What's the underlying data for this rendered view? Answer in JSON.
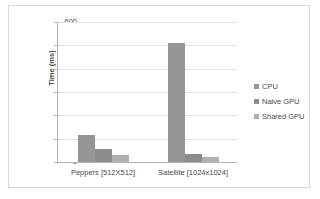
{
  "chart_data": {
    "type": "bar",
    "title": "",
    "subtitle": "",
    "xlabel": "",
    "ylabel": "Time (ms)",
    "ylim": [
      0,
      600
    ],
    "yticks": [
      0,
      100,
      200,
      300,
      400,
      500,
      600
    ],
    "ytick_labels": [
      "0",
      "100",
      "200",
      "300",
      "400",
      "500",
      "600"
    ],
    "grid": "horizontal",
    "legend_position": "right",
    "categories": [
      "Peppers [512X512]",
      "Satellite [1024x1024]"
    ],
    "series": [
      {
        "name": "CPU",
        "color": "#969696",
        "values": [
          115,
          508
        ]
      },
      {
        "name": "Naive GPU",
        "color": "#8c8c8c",
        "values": [
          57,
          35
        ]
      },
      {
        "name": "Shared GPU",
        "color": "#b0b0b0",
        "values": [
          28,
          20
        ]
      }
    ]
  },
  "colors": {
    "frame_border": "#d9d9d9",
    "axis_line": "#b3b3b3",
    "gridline": "#e2e2e2",
    "text": "#4a4a4a",
    "plot_background": "#ffffff"
  }
}
